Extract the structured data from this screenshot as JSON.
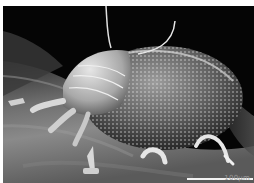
{
  "image": {
    "subject": "scanning electron micrograph of a mite on a leaf surface",
    "style": "grayscale SEM",
    "border_color": "#ffffff",
    "background_color": "#050505"
  },
  "scale_bar": {
    "label": "100μm",
    "color": "#f2f2f2"
  }
}
